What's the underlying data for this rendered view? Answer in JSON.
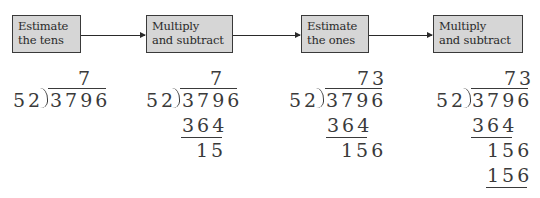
{
  "steps": [
    {
      "line1": "Estimate",
      "line2": "the tens"
    },
    {
      "line1": "Multiply",
      "line2": "and subtract"
    },
    {
      "line1": "Estimate",
      "line2": "the ones"
    },
    {
      "line1": "Multiply",
      "line2": "and subtract"
    }
  ],
  "problems": [
    {
      "quotient": "7",
      "divisor": "52",
      "dividend": "3796",
      "lines": []
    },
    {
      "quotient": "7",
      "divisor": "52",
      "dividend": "3796",
      "lines": [
        "364",
        "15"
      ]
    },
    {
      "quotient": "73",
      "divisor": "52",
      "dividend": "3796",
      "lines": [
        "364",
        "156"
      ]
    },
    {
      "quotient": "73",
      "divisor": "52",
      "dividend": "3796",
      "lines": [
        "364",
        "156",
        "156"
      ]
    }
  ],
  "colors": {
    "box_fill": "#d6d6d6",
    "box_border": "#3a3a3a",
    "text": "#2a2a2a"
  }
}
